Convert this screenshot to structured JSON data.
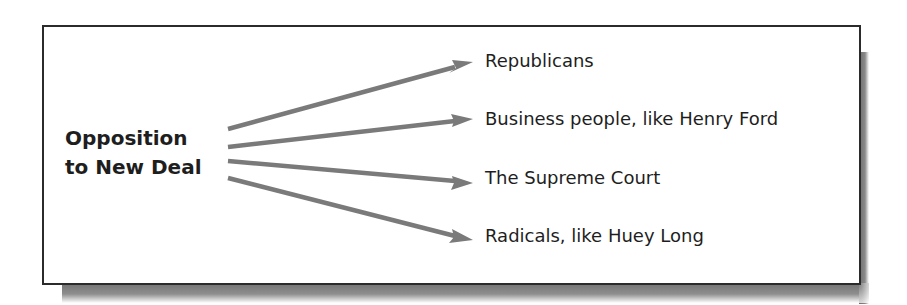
{
  "diagram": {
    "source": {
      "lines": [
        "Opposition",
        "to New Deal"
      ]
    },
    "targets": [
      {
        "label": "Republicans"
      },
      {
        "label": "Business people, like Henry Ford"
      },
      {
        "label": "The Supreme Court"
      },
      {
        "label": "Radicals, like Huey Long"
      }
    ],
    "colors": {
      "arrow": "#7a7a7a",
      "border": "#2b2b2b",
      "text": "#1e1e1e",
      "shadow": "#6e6e6e"
    }
  }
}
